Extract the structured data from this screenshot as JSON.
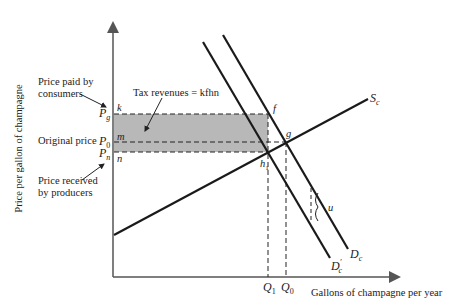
{
  "diagram": {
    "y_axis_label": "Price per gallon of champagne",
    "x_axis_label": "Gallons of champagne per year",
    "annotations": {
      "price_paid": "Price paid by\nconsumers",
      "price_paid_l1": "Price paid by",
      "price_paid_l2": "consumers",
      "original_price": "Original price",
      "price_received_l1": "Price received",
      "price_received_l2": "by producers",
      "tax_revenues": "Tax revenues = kfhn"
    },
    "price_labels": {
      "pg": "P",
      "pg_sub": "g",
      "p0": "P",
      "p0_sub": "0",
      "pn": "P",
      "pn_sub": "n"
    },
    "point_labels": {
      "k": "k",
      "m": "m",
      "n": "n",
      "f": "f",
      "g": "g",
      "h": "h",
      "h_sub": "1",
      "u": "u"
    },
    "quantity_labels": {
      "q1": "Q",
      "q1_sub": "1",
      "q0": "Q",
      "q0_sub": "0"
    },
    "curve_labels": {
      "supply": "S",
      "supply_sub": "c",
      "demand": "D",
      "demand_sub": "c",
      "demand_shifted": "D",
      "demand_shifted_sup": "′",
      "demand_shifted_sub": "c"
    },
    "colors": {
      "line": "#1a1a1a",
      "axis": "#555555",
      "shade": "#b8b8b8"
    }
  }
}
